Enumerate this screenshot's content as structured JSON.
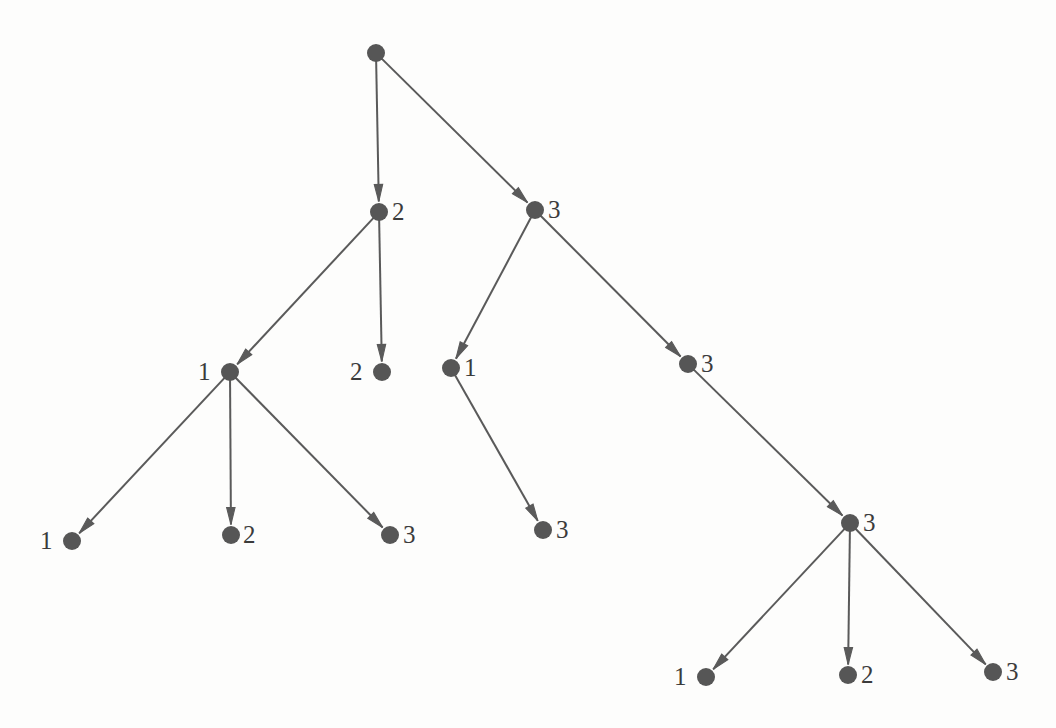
{
  "figure": {
    "type": "tree-diagram",
    "title": "",
    "background_color": "#fdfdfc",
    "node_color": "#565656",
    "edge_color": "#5a5a5a",
    "label_color": "#3b3b3b",
    "node_radius": 9,
    "edge_width": 2,
    "label_font_size": 25
  },
  "nodes": [
    {
      "id": "root",
      "label": "",
      "x": 376,
      "y": 53,
      "label_x": 0,
      "label_y": 0,
      "label_side": "none"
    },
    {
      "id": "n2",
      "label": "2",
      "x": 379,
      "y": 212,
      "label_x": 392,
      "label_y": 199,
      "label_side": "right"
    },
    {
      "id": "n3",
      "label": "3",
      "x": 535,
      "y": 210,
      "label_x": 548,
      "label_y": 197,
      "label_side": "right"
    },
    {
      "id": "n2-1",
      "label": "1",
      "x": 230,
      "y": 372,
      "label_x": 198,
      "label_y": 359,
      "label_side": "left"
    },
    {
      "id": "n2-2",
      "label": "2",
      "x": 382,
      "y": 372,
      "label_x": 350,
      "label_y": 359,
      "label_side": "left"
    },
    {
      "id": "n3-1",
      "label": "1",
      "x": 451,
      "y": 368,
      "label_x": 464,
      "label_y": 355,
      "label_side": "right"
    },
    {
      "id": "n3-3",
      "label": "3",
      "x": 688,
      "y": 364,
      "label_x": 701,
      "label_y": 351,
      "label_side": "right"
    },
    {
      "id": "n2-1-1",
      "label": "1",
      "x": 72,
      "y": 541,
      "label_x": 40,
      "label_y": 528,
      "label_side": "left"
    },
    {
      "id": "n2-1-2",
      "label": "2",
      "x": 231,
      "y": 535,
      "label_x": 243,
      "label_y": 522,
      "label_side": "right"
    },
    {
      "id": "n2-1-3",
      "label": "3",
      "x": 390,
      "y": 535,
      "label_x": 403,
      "label_y": 522,
      "label_side": "right"
    },
    {
      "id": "n3-1-3",
      "label": "3",
      "x": 543,
      "y": 530,
      "label_x": 556,
      "label_y": 517,
      "label_side": "right"
    },
    {
      "id": "n3-3-3",
      "label": "3",
      "x": 850,
      "y": 523,
      "label_x": 863,
      "label_y": 510,
      "label_side": "right"
    },
    {
      "id": "n3-3-3-1",
      "label": "1",
      "x": 706,
      "y": 677,
      "label_x": 674,
      "label_y": 664,
      "label_side": "left"
    },
    {
      "id": "n3-3-3-2",
      "label": "2",
      "x": 848,
      "y": 675,
      "label_x": 861,
      "label_y": 662,
      "label_side": "right"
    },
    {
      "id": "n3-3-3-3",
      "label": "3",
      "x": 993,
      "y": 672,
      "label_x": 1006,
      "label_y": 659,
      "label_side": "right"
    }
  ],
  "edges": [
    {
      "from": "root",
      "to": "n2"
    },
    {
      "from": "root",
      "to": "n3"
    },
    {
      "from": "n2",
      "to": "n2-1"
    },
    {
      "from": "n2",
      "to": "n2-2"
    },
    {
      "from": "n3",
      "to": "n3-1"
    },
    {
      "from": "n3",
      "to": "n3-3"
    },
    {
      "from": "n2-1",
      "to": "n2-1-1"
    },
    {
      "from": "n2-1",
      "to": "n2-1-2"
    },
    {
      "from": "n2-1",
      "to": "n2-1-3"
    },
    {
      "from": "n3-1",
      "to": "n3-1-3"
    },
    {
      "from": "n3-3",
      "to": "n3-3-3"
    },
    {
      "from": "n3-3-3",
      "to": "n3-3-3-1"
    },
    {
      "from": "n3-3-3",
      "to": "n3-3-3-2"
    },
    {
      "from": "n3-3-3",
      "to": "n3-3-3-3"
    }
  ]
}
